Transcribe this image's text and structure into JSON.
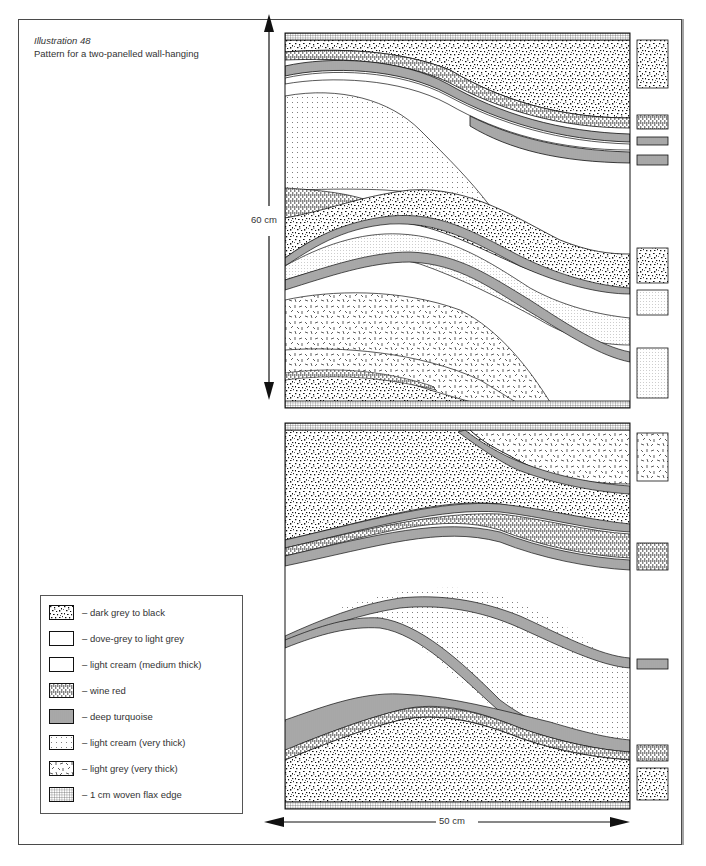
{
  "caption": {
    "title": "Illustration 48",
    "subtitle": "Pattern for a two-panelled wall-hanging"
  },
  "dimensions": {
    "height_label": "60 cm",
    "width_label": "50 cm"
  },
  "legend": {
    "items": [
      {
        "pattern": "dark-speckle",
        "label": "– dark grey to black"
      },
      {
        "pattern": "blank",
        "label": "– dove-grey to light grey"
      },
      {
        "pattern": "blank",
        "label": "– light cream (medium thick)"
      },
      {
        "pattern": "brick",
        "label": "– wine red"
      },
      {
        "pattern": "vertical-lines",
        "label": "– deep turquoise"
      },
      {
        "pattern": "fine-dots",
        "label": "– light cream (very thick)"
      },
      {
        "pattern": "dashes",
        "label": "– light grey (very thick)"
      },
      {
        "pattern": "grid",
        "label": "– 1 cm woven flax edge"
      }
    ]
  },
  "panels": [
    {
      "name": "top-panel",
      "side_swatches": [
        "dark-speckle",
        "brick",
        "vertical-lines",
        "vertical-lines",
        "dark-speckle",
        "light-dots",
        "light-dots"
      ]
    },
    {
      "name": "bottom-panel",
      "side_swatches": [
        "dashes",
        "brick",
        "vertical-lines",
        "brick",
        "dark-speckle"
      ]
    }
  ],
  "colors": {
    "ink": "#1a1a1a",
    "paper": "#ffffff",
    "frame": "#4a4a4a"
  }
}
